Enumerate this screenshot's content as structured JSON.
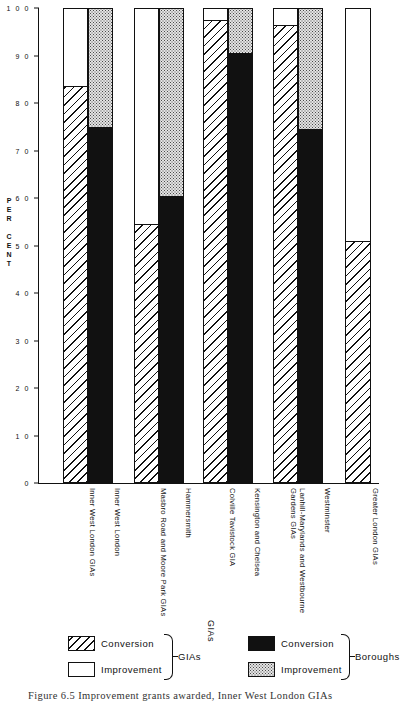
{
  "figure": {
    "caption": "Figure 6.5   Improvement grants awarded,  Inner West London GIAs"
  },
  "axis": {
    "y_title_chars": [
      "P",
      "E",
      "R",
      "",
      "C",
      "E",
      "N",
      "T"
    ],
    "y_ticks": [
      "100",
      "90",
      "80",
      "70",
      "60",
      "50",
      "40",
      "30",
      "20",
      "10",
      "0"
    ]
  },
  "legend": {
    "gias": {
      "group_label": "GIAs",
      "items": [
        {
          "label": "Conversion",
          "fill": "hatch"
        },
        {
          "label": "Improvement",
          "fill": "white"
        }
      ]
    },
    "boroughs": {
      "group_label": "Boroughs",
      "items": [
        {
          "label": "Conversion",
          "fill": "black"
        },
        {
          "label": "Improvement",
          "fill": "dots"
        }
      ]
    },
    "stray_label": "GIAs"
  },
  "chart_data": {
    "type": "bar",
    "title": "Improvement grants awarded, Inner West London GIAs",
    "xlabel": "",
    "ylabel": "PER CENT",
    "ylim": [
      0,
      100
    ],
    "ytick_step": 10,
    "grid": false,
    "stacked": true,
    "legend_position": "bottom",
    "series": [
      {
        "name": "Conversion",
        "group": "GIAs",
        "fill": "hatch"
      },
      {
        "name": "Improvement",
        "group": "GIAs",
        "fill": "white"
      },
      {
        "name": "Conversion",
        "group": "Boroughs",
        "fill": "black"
      },
      {
        "name": "Improvement",
        "group": "Boroughs",
        "fill": "dots"
      }
    ],
    "categories": [
      "Inner West London GIAs",
      "Inner West London",
      "Masbro Road and Moore Park GIAs",
      "Hammersmith",
      "Colville Tavistock GIA",
      "Kensington and Chelsea",
      "Lanhill-Marylands and Westbourne Gardens GIAs",
      "Westminster",
      "Greater London GIAs"
    ],
    "bars": [
      {
        "label": "Inner West London GIAs",
        "kind": "gia",
        "conversion": 83.5,
        "improvement": 16.5
      },
      {
        "label": "Inner West London",
        "kind": "borough",
        "conversion": 75.0,
        "improvement": 25.0
      },
      {
        "label": "Masbro Road and Moore Park GIAs",
        "kind": "gia",
        "conversion": 54.5,
        "improvement": 45.5
      },
      {
        "label": "Hammersmith",
        "kind": "borough",
        "conversion": 60.5,
        "improvement": 39.5
      },
      {
        "label": "Colville Tavistock GIA",
        "kind": "gia",
        "conversion": 97.5,
        "improvement": 2.5
      },
      {
        "label": "Kensington and Chelsea",
        "kind": "borough",
        "conversion": 90.5,
        "improvement": 9.5
      },
      {
        "label": "Lanhill-Marylands and Westbourne Gardens GIAs",
        "kind": "gia",
        "conversion": 96.5,
        "improvement": 3.5
      },
      {
        "label": "Westminster",
        "kind": "borough",
        "conversion": 74.5,
        "improvement": 25.5
      },
      {
        "label": "Greater London GIAs",
        "kind": "gia",
        "conversion": 51.0,
        "improvement": 49.0
      }
    ]
  }
}
